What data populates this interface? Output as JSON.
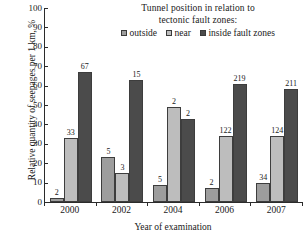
{
  "chart_data": {
    "type": "bar",
    "title": "Tunnel position in relation to tectonic fault zones:",
    "title_lines": [
      "Tunnel position in relation to",
      "tectonic fault zones:"
    ],
    "xlabel": "Year of examination",
    "ylabel": "Relative quantity of seepages per 1 km, %",
    "categories": [
      "2000",
      "2002",
      "2004",
      "2006",
      "2007"
    ],
    "ylim": [
      0,
      100
    ],
    "ytick_step": 10,
    "yticks": [
      "100",
      "90",
      "80",
      "70",
      "60",
      "50",
      "40",
      "30",
      "20",
      "10",
      "0"
    ],
    "grid": false,
    "legend_position": "top-center",
    "series": [
      {
        "name": "outside",
        "color": "#9d9d9d",
        "values": [
          2,
          23,
          9,
          7,
          10
        ],
        "point_labels": [
          "2",
          "5",
          "5",
          "2",
          "34"
        ]
      },
      {
        "name": "near",
        "color": "#bdbdbd",
        "values": [
          33,
          15,
          49,
          34,
          34
        ],
        "point_labels": [
          "33",
          "3",
          "2",
          "122",
          "124"
        ]
      },
      {
        "name": "inside fault zones",
        "color": "#4b4b4b",
        "values": [
          67,
          63,
          43,
          61,
          58
        ],
        "point_labels": [
          "67",
          "15",
          "2",
          "219",
          "211"
        ]
      }
    ]
  },
  "colors": {
    "axis": "#2b2b2b",
    "text": "#1a1a1a",
    "background": "#ffffff",
    "series_outside": "#9d9d9d",
    "series_near": "#bdbdbd",
    "series_inside": "#4b4b4b"
  }
}
